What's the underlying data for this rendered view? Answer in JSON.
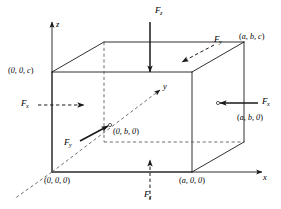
{
  "figure": {
    "stroke_color": "#1a1a1a",
    "dashed_color": "#555555",
    "background": "#ffffff"
  },
  "axes": [
    {
      "name": "x-axis",
      "label": "x",
      "direction": "right"
    },
    {
      "name": "y-axis",
      "label": "y",
      "direction": "up-right-oblique"
    },
    {
      "name": "z-axis",
      "label": "z",
      "direction": "up"
    }
  ],
  "vertices": [
    {
      "name": "origin",
      "label_open": "(",
      "label": "0, 0, 0",
      "label_close": ")"
    },
    {
      "name": "x-corner",
      "label_open": "(",
      "label": "a, 0, 0",
      "label_close": ")"
    },
    {
      "name": "z-corner",
      "label_open": "(",
      "label": "0, 0, c",
      "label_close": ")"
    },
    {
      "name": "y-corner",
      "label_open": "(",
      "label": "0, b, 0",
      "label_close": ")"
    },
    {
      "name": "xy-corner",
      "label_open": "(",
      "label": "a, b, 0",
      "label_close": ")"
    },
    {
      "name": "xyz-corner",
      "label_open": "(",
      "label": "a, b, c",
      "label_close": ")"
    }
  ],
  "forces": [
    {
      "name": "force-z-top",
      "symbol": "F",
      "subscript": "z",
      "direction": "down",
      "line_style": "solid",
      "position": "top-face"
    },
    {
      "name": "force-z-bottom",
      "symbol": "F",
      "subscript": "z",
      "direction": "up",
      "line_style": "dashed",
      "position": "bottom-face"
    },
    {
      "name": "force-x-left",
      "symbol": "F",
      "subscript": "x",
      "direction": "right",
      "line_style": "dashed",
      "position": "left-face"
    },
    {
      "name": "force-x-right",
      "symbol": "F",
      "subscript": "x",
      "direction": "left",
      "line_style": "solid",
      "position": "right-face"
    },
    {
      "name": "force-y-back",
      "symbol": "F",
      "subscript": "y",
      "direction": "down-left",
      "line_style": "dashed",
      "position": "back-face"
    },
    {
      "name": "force-y-front",
      "symbol": "F",
      "subscript": "y",
      "direction": "up-right",
      "line_style": "solid",
      "position": "front-interior"
    }
  ]
}
